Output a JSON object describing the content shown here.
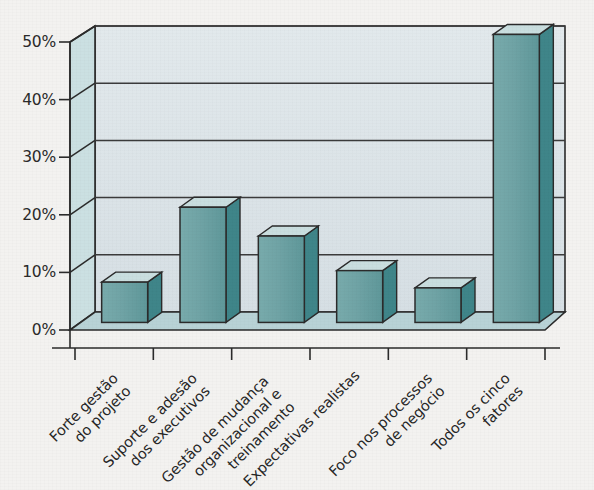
{
  "chart_data": {
    "type": "bar",
    "title": "",
    "subtitle": "",
    "xlabel": "",
    "ylabel": "",
    "ylim": [
      0,
      50
    ],
    "grid": true,
    "legend": false,
    "style": "3d-column",
    "categories": [
      "Forte gestão\ndo projeto",
      "Suporte e adesão\ndos executivos",
      "Gestão de mudança\norganizacional e\ntreinamento",
      "Expectativas realistas",
      "Foco nos processos\nde negócio",
      "Todos os cinco\nfatores"
    ],
    "category_lines": [
      [
        "Forte gestão",
        "do projeto"
      ],
      [
        "Suporte e adesão",
        "dos executivos"
      ],
      [
        "Gestão de mudança",
        "organizacional e",
        "treinamento"
      ],
      [
        "Expectativas realistas"
      ],
      [
        "Foco nos processos",
        "de negócio"
      ],
      [
        "Todos os cinco",
        "fatores"
      ]
    ],
    "values": [
      7,
      20,
      15,
      9,
      6,
      50
    ],
    "value_labels": [
      "7%",
      "20%",
      "15%",
      "9%",
      "6%",
      "50%"
    ],
    "ytick_values": [
      0,
      10,
      20,
      30,
      40,
      50
    ],
    "ytick_labels": [
      "0%",
      "10%",
      "20%",
      "30%",
      "40%",
      "50%"
    ]
  },
  "colors": {
    "bar_front": "#6FA3A5",
    "bar_side": "#3F8589",
    "bar_top": "#C9DEDF",
    "wall_back": "#DDE5E9",
    "wall_left": "#CBE0E2",
    "floor": "#B8D2D6",
    "gridline": "#3B3B3B",
    "outline": "#2B2B2B",
    "text": "#262626",
    "page_background": "#F3F2F0"
  }
}
